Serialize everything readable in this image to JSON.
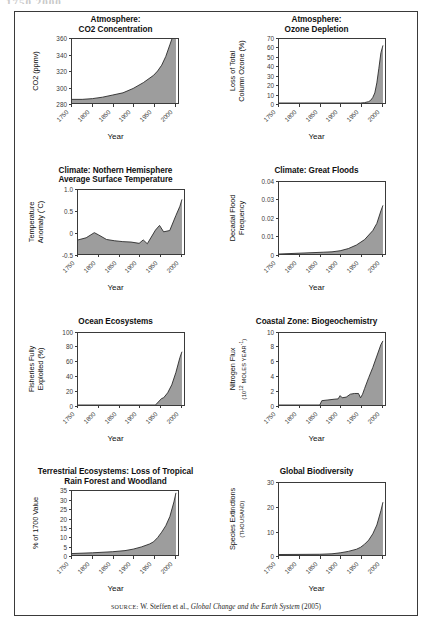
{
  "top_clipped_text": "1750 2000",
  "figure": {
    "source_prefix": "SOURCE:",
    "source_text": " W. Steffen et al., ",
    "source_title": "Global Change and the Earth System",
    "source_year": " (2005)"
  },
  "axis_common": {
    "xlabel": "Year",
    "xticks": [
      "1750",
      "1800",
      "1850",
      "1900",
      "1950",
      "2000"
    ],
    "xlim": [
      1750,
      2010
    ]
  },
  "chart_data": [
    {
      "id": "co2-concentration",
      "type": "area",
      "title_line1": "Atmosphere:",
      "title_line2": "CO2 Concentration",
      "ylabel": "CO2 (ppmv)",
      "xlabel": "Year",
      "yticks": [
        "280",
        "300",
        "320",
        "340",
        "360"
      ],
      "ylim": [
        272,
        360
      ],
      "xlim": [
        1750,
        2010
      ],
      "grid": false,
      "x": [
        1750,
        1775,
        1800,
        1825,
        1850,
        1875,
        1900,
        1925,
        1950,
        1960,
        1970,
        1980,
        1990,
        2000,
        2005
      ],
      "values": [
        277,
        277,
        278,
        280,
        283,
        286,
        292,
        300,
        310,
        316,
        324,
        336,
        352,
        368,
        378
      ]
    },
    {
      "id": "ozone-depletion",
      "type": "area",
      "title_line1": "Atmosphere:",
      "title_line2": "Ozone Depletion",
      "ylabel": "Loss of Total\nColumn Ozone (%)",
      "xlabel": "Year",
      "yticks": [
        "0",
        "10",
        "20",
        "30",
        "40",
        "50",
        "60",
        "70"
      ],
      "ylim": [
        0,
        70
      ],
      "xlim": [
        1750,
        2010
      ],
      "grid": false,
      "x": [
        1750,
        1900,
        1950,
        1960,
        1970,
        1975,
        1980,
        1985,
        1990,
        1995,
        2000,
        2005
      ],
      "values": [
        0,
        0,
        0,
        0.4,
        1.5,
        3,
        6,
        11,
        22,
        38,
        55,
        63
      ]
    },
    {
      "id": "surface-temperature",
      "type": "area",
      "title_line1": "Climate: Nothern Hemisphere",
      "title_line2": "Average Surface Temperature",
      "ylabel": "Temperature\nAnomaly (˚C)",
      "xlabel": "Year",
      "yticks": [
        "-0.5",
        "0",
        "0.5",
        "1.0"
      ],
      "ylim": [
        -0.5,
        1.0
      ],
      "xlim": [
        1750,
        2010
      ],
      "grid": false,
      "x": [
        1750,
        1770,
        1790,
        1800,
        1820,
        1840,
        1860,
        1880,
        1900,
        1910,
        1920,
        1940,
        1950,
        1960,
        1975,
        1990,
        2000,
        2005
      ],
      "values": [
        -0.17,
        -0.12,
        0.0,
        -0.05,
        -0.16,
        -0.19,
        -0.21,
        -0.22,
        -0.25,
        -0.17,
        -0.26,
        0.06,
        0.17,
        0.02,
        0.05,
        0.4,
        0.62,
        0.78
      ]
    },
    {
      "id": "great-floods",
      "type": "area",
      "title_line1": "Climate: Great Floods",
      "title_line2": "",
      "ylabel": "Decadal Flood\nFrequency",
      "xlabel": "Year",
      "yticks": [
        "0",
        "0.01",
        "0.02",
        "0.03",
        "0.04"
      ],
      "ylim": [
        0,
        0.04
      ],
      "xlim": [
        1750,
        2010
      ],
      "grid": false,
      "x": [
        1750,
        1860,
        1880,
        1900,
        1920,
        1940,
        1960,
        1980,
        1990,
        2000,
        2005
      ],
      "values": [
        0,
        0.001,
        0.0012,
        0.0018,
        0.003,
        0.005,
        0.008,
        0.013,
        0.017,
        0.024,
        0.027
      ]
    },
    {
      "id": "ocean-ecosystems",
      "type": "area",
      "title_line1": "Ocean Ecosystems",
      "title_line2": "",
      "ylabel": "Fisheries Fully\nExploited (%)",
      "xlabel": "Year",
      "yticks": [
        "0",
        "20",
        "40",
        "60",
        "80",
        "100"
      ],
      "ylim": [
        0,
        100
      ],
      "xlim": [
        1750,
        2010
      ],
      "grid": false,
      "x": [
        1750,
        1940,
        1955,
        1960,
        1970,
        1980,
        1990,
        2000,
        2005
      ],
      "values": [
        0,
        0,
        9,
        10,
        17,
        28,
        45,
        66,
        74
      ]
    },
    {
      "id": "coastal-biogeochemistry",
      "type": "area",
      "title_line1": "Coastal Zone: Biogeochemistry",
      "title_line2": "",
      "ylabel": "Nitrogen Flux\n(10^12 MOLES YEAR^-1)",
      "ylabel_main": "Nitrogen Flux",
      "ylabel_sub": "MOLES YEAR",
      "xlabel": "Year",
      "yticks": [
        "0",
        "2",
        "4",
        "6",
        "8",
        "10"
      ],
      "ylim": [
        0,
        10
      ],
      "xlim": [
        1750,
        2010
      ],
      "grid": false,
      "x": [
        1750,
        1850,
        1855,
        1870,
        1885,
        1895,
        1900,
        1905,
        1915,
        1925,
        1935,
        1945,
        1950,
        1955,
        1960,
        1970,
        1980,
        1990,
        2000,
        2005
      ],
      "values": [
        0,
        0,
        0.6,
        0.7,
        0.8,
        0.85,
        1.3,
        1.0,
        1.1,
        1.5,
        1.6,
        1.6,
        1.0,
        1.5,
        2.3,
        3.8,
        5.2,
        6.8,
        8.4,
        8.9
      ]
    },
    {
      "id": "tropical-forest-loss",
      "type": "area",
      "title_line1": "Terrestrial Ecosystems: Loss of Tropical",
      "title_line2": "Rain Forest and Woodland",
      "ylabel": "% of 1700 Value",
      "xlabel": "Year",
      "yticks": [
        "0",
        "5",
        "10",
        "15",
        "20",
        "25",
        "30",
        "35"
      ],
      "ylim": [
        0,
        35
      ],
      "xlim": [
        1750,
        2010
      ],
      "grid": false,
      "x": [
        1750,
        1800,
        1850,
        1880,
        1900,
        1920,
        1940,
        1950,
        1960,
        1970,
        1980,
        1990,
        2000,
        2005
      ],
      "values": [
        0.8,
        1.2,
        1.8,
        2.4,
        3.2,
        4.4,
        6.0,
        7.2,
        9.5,
        12.5,
        16.0,
        21.0,
        29.0,
        34.0
      ]
    },
    {
      "id": "global-biodiversity",
      "type": "area",
      "title_line1": "Global Biodiversity",
      "title_line2": "",
      "ylabel": "Species Extinctions\n(THOUSAND)",
      "ylabel_main": "Species Extinctions",
      "ylabel_sub": "(THOUSAND)",
      "xlabel": "Year",
      "yticks": [
        "0",
        "10",
        "20",
        "30"
      ],
      "ylim": [
        0,
        30
      ],
      "xlim": [
        1750,
        2010
      ],
      "grid": false,
      "x": [
        1750,
        1850,
        1880,
        1900,
        1920,
        1940,
        1950,
        1960,
        1970,
        1980,
        1990,
        2000,
        2005
      ],
      "values": [
        0.2,
        0.3,
        0.5,
        0.9,
        1.5,
        2.4,
        3.2,
        4.5,
        6.2,
        8.8,
        12.5,
        18.5,
        22.0
      ]
    }
  ],
  "style": {
    "fill_color": "#9d9d9d",
    "line_color": "#2b2b2b",
    "frame_color": "#3a3a3a",
    "text_color": "#111111"
  }
}
